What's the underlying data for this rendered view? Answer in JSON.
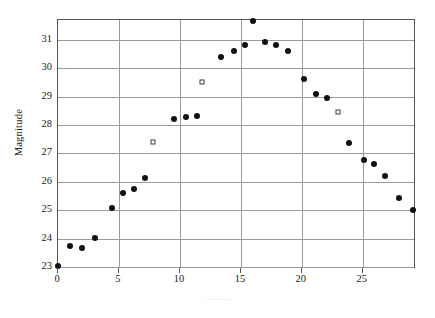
{
  "chart_data": {
    "type": "scatter",
    "title": "",
    "xlabel": "·········",
    "ylabel": "Magnitude",
    "xlim": [
      0,
      29.2
    ],
    "ylim": [
      23,
      31.7
    ],
    "xticks": [
      0,
      5,
      10,
      15,
      20,
      25
    ],
    "yticks": [
      23,
      24,
      25,
      26,
      27,
      28,
      29,
      30,
      31
    ],
    "grid": true,
    "legend": "none",
    "series": [
      {
        "name": "filled-circles",
        "marker": "filled-circle",
        "color": "#101010",
        "points": [
          {
            "x": 0.0,
            "y": 23.02
          },
          {
            "x": 1.0,
            "y": 23.75
          },
          {
            "x": 2.0,
            "y": 23.68
          },
          {
            "x": 3.0,
            "y": 24.02
          },
          {
            "x": 4.4,
            "y": 25.07
          },
          {
            "x": 5.3,
            "y": 25.62
          },
          {
            "x": 6.2,
            "y": 25.74
          },
          {
            "x": 7.1,
            "y": 26.14
          },
          {
            "x": 9.5,
            "y": 28.2
          },
          {
            "x": 10.5,
            "y": 28.3
          },
          {
            "x": 11.4,
            "y": 28.33
          },
          {
            "x": 13.4,
            "y": 30.38
          },
          {
            "x": 14.4,
            "y": 30.62
          },
          {
            "x": 15.3,
            "y": 30.82
          },
          {
            "x": 16.0,
            "y": 31.68
          },
          {
            "x": 17.0,
            "y": 30.92
          },
          {
            "x": 17.9,
            "y": 30.82
          },
          {
            "x": 18.9,
            "y": 30.62
          },
          {
            "x": 20.2,
            "y": 29.62
          },
          {
            "x": 21.2,
            "y": 29.08
          },
          {
            "x": 22.1,
            "y": 28.95
          },
          {
            "x": 23.9,
            "y": 27.38
          },
          {
            "x": 25.1,
            "y": 26.78
          },
          {
            "x": 25.9,
            "y": 26.62
          },
          {
            "x": 26.8,
            "y": 26.2
          },
          {
            "x": 28.0,
            "y": 25.42
          },
          {
            "x": 29.1,
            "y": 25.0
          }
        ]
      },
      {
        "name": "open-squares",
        "marker": "open-square",
        "color": "#3c3c3c",
        "points": [
          {
            "x": 7.8,
            "y": 27.42
          },
          {
            "x": 11.8,
            "y": 29.5
          },
          {
            "x": 23.0,
            "y": 28.45
          }
        ]
      }
    ]
  },
  "axes": {
    "y_label": "Magnitude",
    "x_label": "·········",
    "ytick_labels": [
      "31",
      "30",
      "29",
      "28",
      "27",
      "26",
      "25",
      "24",
      "23"
    ],
    "xtick_labels": [
      "0",
      "5",
      "10",
      "15",
      "20",
      "25"
    ]
  },
  "colors": {
    "frame": "#555555",
    "grid": "#9a9a9a",
    "marker_filled": "#101010",
    "marker_open_edge": "#3c3c3c",
    "background": "#ffffff",
    "text": "#1a1a1a",
    "xlabel_faint": "#b4b4b4"
  }
}
